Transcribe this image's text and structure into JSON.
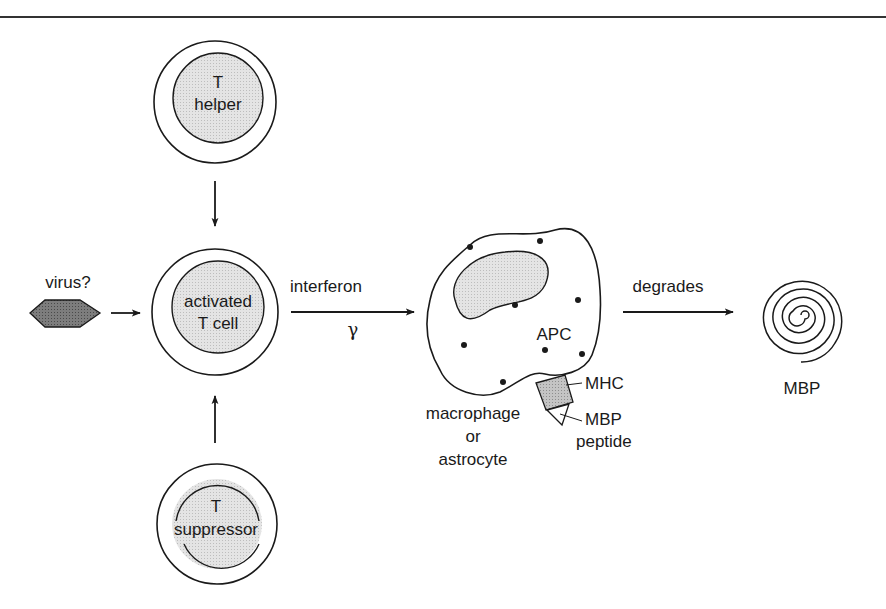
{
  "diagram": {
    "colors": {
      "stroke": "#1a1a1a",
      "cell_fill": "#e6e6e6",
      "nucleus_fill": "#dcdcdc",
      "virus_fill": "#7a7a7a",
      "mhc_fill": "#c8c8c8",
      "background": "#ffffff"
    },
    "cells": {
      "t_helper": {
        "line1": "T",
        "line2": "helper"
      },
      "activated": {
        "line1": "activated",
        "line2": "T cell"
      },
      "t_suppressor": {
        "line1": "T",
        "line2": "suppressor"
      }
    },
    "virus": {
      "label": "virus?"
    },
    "interferon": {
      "label": "interferon",
      "symbol": "γ"
    },
    "apc": {
      "label": "APC",
      "caption_line1": "macrophage",
      "caption_line2": "or",
      "caption_line3": "astrocyte",
      "mhc_label": "MHC",
      "peptide_line1": "MBP",
      "peptide_line2": "peptide"
    },
    "degrades": {
      "label": "degrades"
    },
    "mbp": {
      "label": "MBP"
    }
  }
}
